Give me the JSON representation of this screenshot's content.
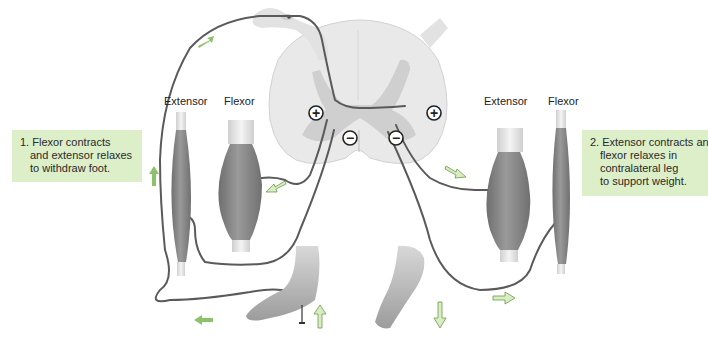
{
  "figure": {
    "type": "crossed extensor reflex diagram",
    "left_side": {
      "muscle_labels": {
        "extensor": "Extensor",
        "flexor": "Flexor"
      },
      "callout": {
        "number": "1.",
        "lines": [
          "1. Flexor contracts",
          "and extensor relaxes",
          "to withdraw foot."
        ]
      }
    },
    "right_side": {
      "muscle_labels": {
        "extensor": "Extensor",
        "flexor": "Flexor"
      },
      "callout": {
        "number": "2.",
        "lines": [
          "2. Extensor contracts and",
          "flexor relaxes in",
          "contralateral leg",
          "to support weight."
        ]
      }
    },
    "synapse_symbols": {
      "excitatory": "+",
      "inhibitory": "−"
    },
    "colors": {
      "callout_bg": "#dcefc9",
      "arrow_green": "#8cc26a",
      "arrow_fill_light": "#d9ecc4",
      "nerve": "#555555",
      "spinal_cord": "#e6e6e6",
      "gray_matter": "#cfcfcf",
      "muscle": "#8a8a8a"
    }
  }
}
